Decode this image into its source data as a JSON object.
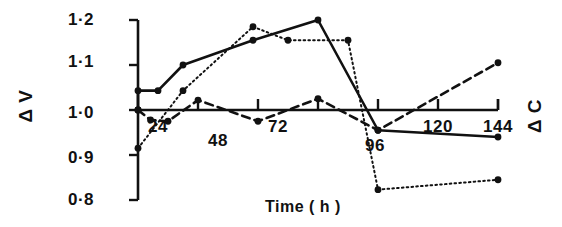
{
  "chart_data": {
    "type": "line",
    "title": "",
    "xlabel": "Time ( h )",
    "ylabel_left": "Δ V",
    "ylabel_right": "Δ C",
    "xlim": [
      0,
      144
    ],
    "ylim": [
      0.8,
      1.2
    ],
    "grid": false,
    "legend_position": "none",
    "xticks": [
      0,
      24,
      48,
      72,
      96,
      120,
      144
    ],
    "xtick_labels": [
      "",
      "24",
      "48",
      "72",
      "96",
      "120",
      "144"
    ],
    "yticks": [
      0.8,
      0.9,
      1.0,
      1.1,
      1.2
    ],
    "ytick_labels": [
      "0·8",
      "0·9",
      "1·0",
      "1·1",
      "1·2"
    ],
    "series": [
      {
        "name": "solid",
        "style": "solid",
        "marker": "filled-circle",
        "x": [
          0,
          0,
          8,
          18,
          46,
          72,
          96,
          144
        ],
        "y": [
          1.0,
          1.043,
          1.043,
          1.1,
          1.155,
          1.2,
          0.955,
          0.94
        ]
      },
      {
        "name": "dotted",
        "style": "dotted",
        "marker": "filled-circle",
        "x": [
          0,
          0,
          18,
          46,
          60,
          84,
          96,
          144
        ],
        "y": [
          1.0,
          0.915,
          1.043,
          1.185,
          1.155,
          1.155,
          0.823,
          0.845
        ]
      },
      {
        "name": "dashed",
        "style": "dashed",
        "marker": "filled-circle",
        "x": [
          0,
          5,
          12,
          24,
          48,
          72,
          96,
          144
        ],
        "y": [
          1.0,
          0.978,
          0.975,
          1.022,
          0.975,
          1.025,
          0.955,
          1.105
        ]
      }
    ]
  },
  "axes": {
    "y_labels": [
      "1·2",
      "1·1",
      "1·0",
      "0·9",
      "0·8"
    ],
    "x_labels": [
      "24",
      "48",
      "72",
      "96",
      "120",
      "144"
    ],
    "left_axis_title": "Δ V",
    "right_axis_title": "Δ C",
    "x_axis_title": "Time ( h )"
  },
  "colors": {
    "ink": "#111111",
    "background": "#ffffff"
  }
}
